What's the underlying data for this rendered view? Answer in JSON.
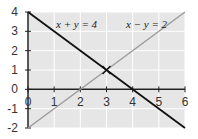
{
  "chart_data": {
    "type": "line",
    "title": "",
    "xlabel": "",
    "ylabel": "",
    "xlim": [
      0,
      6
    ],
    "ylim": [
      -2,
      4
    ],
    "grid": true,
    "x_ticks": [
      "0",
      "1",
      "2",
      "3",
      "4",
      "5",
      "6"
    ],
    "y_ticks": [
      "4",
      "3",
      "2",
      "1",
      "0",
      "-1",
      "-2"
    ],
    "series": [
      {
        "name": "x + y = 4",
        "color": "#111111",
        "x": [
          0,
          6
        ],
        "y": [
          4,
          -2
        ]
      },
      {
        "name": "x − y = 2",
        "color": "#9a9a9a",
        "x": [
          0,
          6
        ],
        "y": [
          -2,
          4
        ]
      }
    ],
    "annotations": [
      {
        "text": "x + y = 4",
        "x": 1.8,
        "y": 3.3
      },
      {
        "text": "x − y = 2",
        "x": 4.1,
        "y": 3.3
      },
      {
        "text": "intersection marker",
        "x": 3,
        "y": 1
      }
    ],
    "intersection": {
      "x": 3,
      "y": 1
    }
  },
  "labels": {
    "eq1": "x + y = 4",
    "eq2": "x − y = 2"
  },
  "colors": {
    "plot_background": "#e6e6e6",
    "grid": "#ffffff",
    "axis": "#222222",
    "line1": "#111111",
    "line2": "#9a9a9a"
  }
}
